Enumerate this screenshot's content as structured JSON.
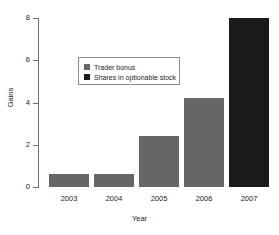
{
  "chart_data": {
    "type": "bar",
    "title": "",
    "subtitle": "",
    "xlabel": "Year",
    "ylabel": "Gains",
    "categories": [
      "2003",
      "2004",
      "2005",
      "2006",
      "2007"
    ],
    "values": [
      0.6,
      0.6,
      2.4,
      4.2,
      8.0
    ],
    "bar_colors": [
      "#666666",
      "#666666",
      "#666666",
      "#666666",
      "#1a1a1a"
    ],
    "ylim": [
      0,
      8
    ],
    "yticks": [
      0,
      2,
      4,
      6,
      8
    ],
    "ytick_labels": [
      "0",
      "2",
      "4",
      "6",
      "8"
    ],
    "xlim_note": "categorical",
    "grid": false,
    "legend_position": "upper-center",
    "legend": [
      {
        "label": "Trader bonus",
        "color": "#666666"
      },
      {
        "label": "Shares in optionable stock",
        "color": "#1a1a1a"
      }
    ],
    "annotations": []
  },
  "axes": {
    "y_title": "Gains",
    "x_title": "Year",
    "axis_color": "#6e6e6e"
  },
  "colors": {
    "background": "#ffffff",
    "text": "#222222",
    "series_light": "#666666",
    "series_dark": "#1a1a1a",
    "legend_border": "#8d8d8d"
  }
}
